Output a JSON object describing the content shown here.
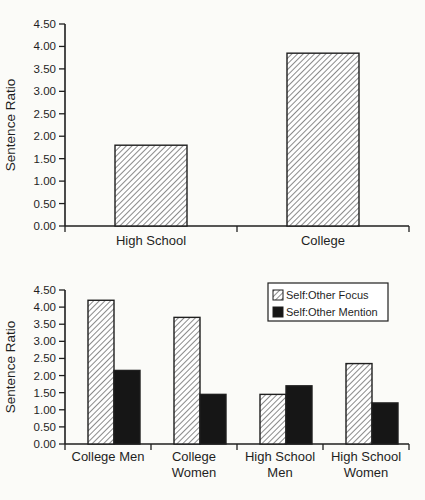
{
  "page": {
    "background": "#fbfbf8",
    "ink": "#1f1f1f",
    "hatch_color": "#3d3d3d",
    "solid_bar_color": "#161616",
    "bar_face_color": "#ffffff"
  },
  "chart_data": [
    {
      "type": "bar",
      "title": "",
      "xlabel": "",
      "ylabel": "Sentence Ratio",
      "categories": [
        "High School",
        "College"
      ],
      "category_label_lines": [
        [
          "High School"
        ],
        [
          "College"
        ]
      ],
      "values": [
        1.8,
        3.85
      ],
      "bar_fill": "hatched",
      "ylim": [
        0,
        4.5
      ],
      "ytick_step": 0.5,
      "ytick_labels": [
        "0.00",
        "0.50",
        "1.00",
        "1.50",
        "2.00",
        "2.50",
        "3.00",
        "3.50",
        "4.00",
        "4.50"
      ],
      "grid": false,
      "legend": null
    },
    {
      "type": "bar",
      "title": "",
      "xlabel": "",
      "ylabel": "Sentence Ratio",
      "categories": [
        "College Men",
        "College Women",
        "High School Men",
        "High School Women"
      ],
      "category_label_lines": [
        [
          "College Men"
        ],
        [
          "College",
          "Women"
        ],
        [
          "High School",
          "Men"
        ],
        [
          "High School",
          "Women"
        ]
      ],
      "series": [
        {
          "name": "Self:Other Focus",
          "values": [
            4.2,
            3.7,
            1.45,
            2.35
          ],
          "fill": "hatched"
        },
        {
          "name": "Self:Other Mention",
          "values": [
            2.15,
            1.45,
            1.7,
            1.2
          ],
          "fill": "solid",
          "color": "#161616"
        }
      ],
      "ylim": [
        0,
        4.5
      ],
      "ytick_step": 0.5,
      "ytick_labels": [
        "0.00",
        "0.50",
        "1.00",
        "1.50",
        "2.00",
        "2.50",
        "3.00",
        "3.50",
        "4.00",
        "4.50"
      ],
      "grid": false,
      "legend": {
        "position": "top-right",
        "entries": [
          "Self:Other Focus",
          "Self:Other Mention"
        ]
      }
    }
  ]
}
